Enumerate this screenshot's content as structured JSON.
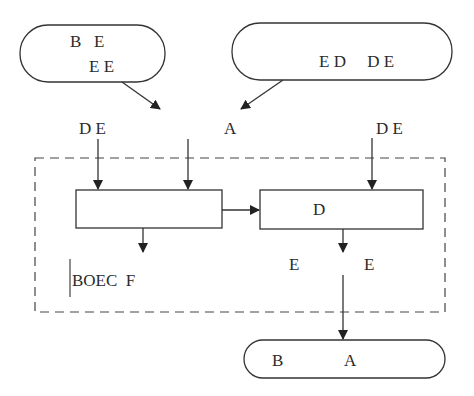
{
  "diagram": {
    "top_left_terminal": {
      "line1": "B   E",
      "line2": "E E"
    },
    "top_right_terminal": {
      "text": "E D     D E"
    },
    "input_labels": {
      "left": "D E",
      "center": "A",
      "right": "D E"
    },
    "left_process": {
      "text": ""
    },
    "right_process": {
      "text": "D"
    },
    "left_output_label": "BOEC  F",
    "right_output_labels": {
      "left": "E",
      "right": "E"
    },
    "bottom_terminal": {
      "left": "B",
      "right": "A"
    },
    "colors": {
      "stroke": "#333333",
      "background": "#ffffff"
    }
  }
}
